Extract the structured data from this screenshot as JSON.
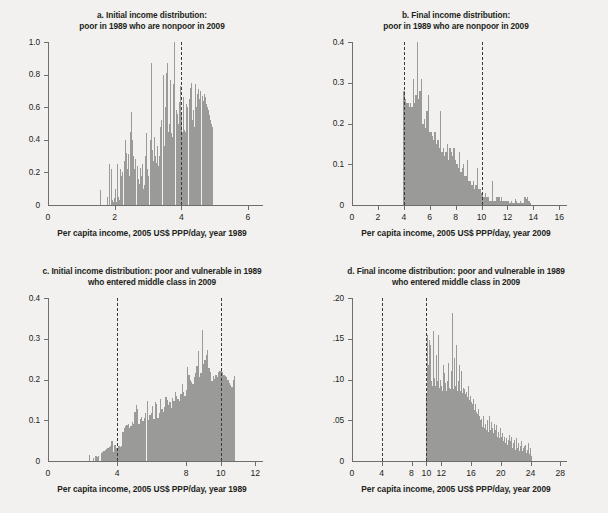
{
  "figure": {
    "background": "#f2f1ef",
    "bar_color": "#9a9a99",
    "axis_color": "#6d6e70",
    "dash_color": "#3a3a3a"
  },
  "chart_data": [
    {
      "id": "panel-a",
      "type": "bar",
      "title": "a.  Initial income distribution:",
      "title_line2": "poor in 1989 who are nonpoor in 2009",
      "xlabel": "Per capita income, 2005 US$ PPP/day, year 1989",
      "ylabel": "",
      "xlim": [
        0,
        6.45
      ],
      "ylim": [
        0,
        1.0
      ],
      "xticks": [
        0,
        2,
        4,
        6
      ],
      "xticklabels": [
        "0",
        "2",
        "4",
        "6"
      ],
      "yticks": [
        0,
        0.2,
        0.4,
        0.6,
        0.8,
        1.0
      ],
      "yticklabels": [
        "0",
        "0.2",
        "0.4",
        "0.6",
        "0.8",
        "1.0"
      ],
      "grid": false,
      "legend": "none",
      "vlines": [
        4.0
      ],
      "bin_start": 1.55,
      "bin_width": 0.0325,
      "values": [
        0.09,
        0,
        0,
        0,
        0,
        0,
        0,
        0.05,
        0,
        0.25,
        0.22,
        0.03,
        0.02,
        0.04,
        0.1,
        0.02,
        0.25,
        0.05,
        0.03,
        0.22,
        0.18,
        0.2,
        0.27,
        0.4,
        0.32,
        0.22,
        0.31,
        0.18,
        0.45,
        0.57,
        0.4,
        0.3,
        0.22,
        0.28,
        0.24,
        0.16,
        0.13,
        0.23,
        0.18,
        0.25,
        0.1,
        0.12,
        0.3,
        0.44,
        0.22,
        0.18,
        0.4,
        0.87,
        0.34,
        0.27,
        0.42,
        0.3,
        0.26,
        0.36,
        0.24,
        0.3,
        0.48,
        0.52,
        0.8,
        0.36,
        0.6,
        0.81,
        0.87,
        0.45,
        0.5,
        0.77,
        0.44,
        0.42,
        0.74,
        1.0,
        0.58,
        0.56,
        0.5,
        0.63,
        0.73,
        0.55,
        0.45,
        0.66,
        0.46,
        0.45,
        0.62,
        0.6,
        0.65,
        0.72,
        0.75,
        0.52,
        0.58,
        0.48,
        0.74,
        0.6,
        0.68,
        0.71,
        0.65,
        0.7,
        0.67,
        0.64,
        0.68,
        0.66,
        0.62,
        0.6,
        0.58,
        0.55,
        0.52,
        0.5,
        0.48
      ]
    },
    {
      "id": "panel-b",
      "type": "bar",
      "title": "b.  Final income distribution:",
      "title_line2": "poor in 1989 who are nonpoor in 2009",
      "xlabel": "Per capita income, 2005 US$ PPP/day, year 2009",
      "ylabel": "",
      "xlim": [
        0,
        16.6
      ],
      "ylim": [
        0,
        0.4
      ],
      "xticks": [
        0,
        2,
        4,
        6,
        8,
        10,
        12,
        14,
        16
      ],
      "xticklabels": [
        "0",
        "2",
        "4",
        "6",
        "8",
        "10",
        "12",
        "14",
        "16"
      ],
      "yticks": [
        0,
        0.1,
        0.2,
        0.3,
        0.4
      ],
      "yticklabels": [
        "0",
        "0.1",
        "0.2",
        "0.3",
        "0.4"
      ],
      "grid": false,
      "legend": "none",
      "vlines": [
        4.0,
        10.0
      ],
      "bin_start": 3.95,
      "bin_width": 0.105,
      "values": [
        0.28,
        0.26,
        0.25,
        0.25,
        0.24,
        0.25,
        0.24,
        0.31,
        0.25,
        0.27,
        0.4,
        0.26,
        0.28,
        0.31,
        0.2,
        0.21,
        0.19,
        0.23,
        0.27,
        0.18,
        0.18,
        0.17,
        0.16,
        0.18,
        0.15,
        0.16,
        0.14,
        0.23,
        0.13,
        0.14,
        0.12,
        0.13,
        0.15,
        0.11,
        0.14,
        0.13,
        0.12,
        0.14,
        0.11,
        0.1,
        0.09,
        0.13,
        0.08,
        0.09,
        0.1,
        0.07,
        0.07,
        0.11,
        0.06,
        0.06,
        0.05,
        0.06,
        0.04,
        0.05,
        0.09,
        0.04,
        0.04,
        0.03,
        0.03,
        0.02,
        0.03,
        0.02,
        0.02,
        0.01,
        0.01,
        0.06,
        0.01,
        0.01,
        0.02,
        0.02,
        0.02,
        0.01,
        0.02,
        0.01,
        0.01,
        0.01,
        0.01,
        0.01,
        0.005,
        0.01,
        0.005,
        0.005,
        0.015,
        0.01,
        0.005,
        0.005,
        0.01,
        0.005,
        0.005,
        0.02,
        0.015,
        0.02,
        0.01,
        0.005
      ]
    },
    {
      "id": "panel-c",
      "type": "bar",
      "title": "c.  Initial income distribution: poor and vulnerable in 1989",
      "title_line2": "who entered middle class in 2009",
      "xlabel": "Per capita income, 2005 US$ PPP/day, year 1989",
      "ylabel": "",
      "xlim": [
        0,
        12.45
      ],
      "ylim": [
        0,
        0.4
      ],
      "xticks": [
        0,
        4,
        8,
        10,
        12
      ],
      "xticklabels": [
        "0",
        "4",
        "8",
        "10",
        "12"
      ],
      "yticks": [
        0,
        0.1,
        0.2,
        0.3,
        0.4
      ],
      "yticklabels": [
        "0",
        "0.1",
        "0.2",
        "0.3",
        "0.4"
      ],
      "grid": false,
      "legend": "none",
      "vlines": [
        4.0,
        10.0
      ],
      "bin_start": 2.35,
      "bin_width": 0.078,
      "values": [
        0.015,
        0,
        0,
        0.008,
        0,
        0.012,
        0.01,
        0.012,
        0,
        0.02,
        0.022,
        0.025,
        0.028,
        0.03,
        0.033,
        0.035,
        0.038,
        0.048,
        0.022,
        0.04,
        0.032,
        0.028,
        0.038,
        0.035,
        0.038,
        0.07,
        0.08,
        0.085,
        0.088,
        0.09,
        0.082,
        0.086,
        0.095,
        0.09,
        0.12,
        0.138,
        0.128,
        0.092,
        0.102,
        0.108,
        0.098,
        0.105,
        0.118,
        0.148,
        0.1,
        0.112,
        0.118,
        0.135,
        0.102,
        0.145,
        0.14,
        0.105,
        0.118,
        0.152,
        0.128,
        0.12,
        0.132,
        0.158,
        0.15,
        0.138,
        0.145,
        0.13,
        0.155,
        0.148,
        0.17,
        0.16,
        0.152,
        0.148,
        0.165,
        0.188,
        0.17,
        0.16,
        0.175,
        0.23,
        0.212,
        0.2,
        0.195,
        0.188,
        0.205,
        0.215,
        0.232,
        0.27,
        0.205,
        0.215,
        0.322,
        0.238,
        0.248,
        0.26,
        0.272,
        0.228,
        0.218,
        0.196,
        0.208,
        0.202,
        0.21,
        0.205,
        0.218,
        0.222,
        0.225,
        0.218,
        0.212,
        0.208,
        0.205,
        0.2,
        0.192,
        0.186,
        0.182,
        0.2,
        0.208
      ]
    },
    {
      "id": "panel-d",
      "type": "bar",
      "title": "d.  Final income distribution: poor and vulnerable in 1989",
      "title_line2": "who entered middle class in 2009",
      "xlabel": "Per capita income, 2005 US$ PPP/day, year 2009",
      "ylabel": "",
      "xlim": [
        0,
        28.9
      ],
      "ylim": [
        0,
        0.2
      ],
      "xticks": [
        0,
        4,
        8,
        10,
        12,
        16,
        20,
        24,
        28
      ],
      "xticklabels": [
        "0",
        "4",
        "8",
        "10",
        "12",
        "16",
        "20",
        "24",
        "28"
      ],
      "yticks": [
        0,
        0.05,
        0.1,
        0.15,
        0.2
      ],
      "yticklabels": [
        "0",
        ".05",
        ".10",
        ".15",
        ".20"
      ],
      "grid": false,
      "legend": "none",
      "vlines": [
        4.0,
        10.0
      ],
      "bin_start": 9.95,
      "bin_width": 0.118,
      "values": [
        0.082,
        0.155,
        0.118,
        0.148,
        0.1,
        0.142,
        0.098,
        0.092,
        0.16,
        0.102,
        0.092,
        0.13,
        0.098,
        0.088,
        0.155,
        0.09,
        0.1,
        0.092,
        0.086,
        0.118,
        0.092,
        0.108,
        0.096,
        0.086,
        0.098,
        0.12,
        0.09,
        0.088,
        0.11,
        0.095,
        0.182,
        0.088,
        0.126,
        0.092,
        0.142,
        0.086,
        0.098,
        0.118,
        0.09,
        0.086,
        0.11,
        0.084,
        0.09,
        0.088,
        0.082,
        0.08,
        0.085,
        0.078,
        0.092,
        0.075,
        0.08,
        0.072,
        0.07,
        0.076,
        0.068,
        0.062,
        0.07,
        0.06,
        0.058,
        0.064,
        0.055,
        0.05,
        0.046,
        0.052,
        0.042,
        0.055,
        0.04,
        0.046,
        0.038,
        0.05,
        0.042,
        0.036,
        0.055,
        0.038,
        0.048,
        0.04,
        0.034,
        0.046,
        0.032,
        0.038,
        0.044,
        0.03,
        0.036,
        0.028,
        0.04,
        0.03,
        0.026,
        0.034,
        0.024,
        0.03,
        0.022,
        0.028,
        0.02,
        0.026,
        0.032,
        0.018,
        0.024,
        0.03,
        0.016,
        0.022,
        0.026,
        0.014,
        0.02,
        0.028,
        0.016,
        0.022,
        0.012,
        0.018,
        0.024,
        0.012,
        0.016,
        0.01,
        0.018,
        0.02,
        0.01,
        0.014,
        0.022,
        0.008,
        0.012,
        0.016,
        0.006
      ]
    }
  ]
}
